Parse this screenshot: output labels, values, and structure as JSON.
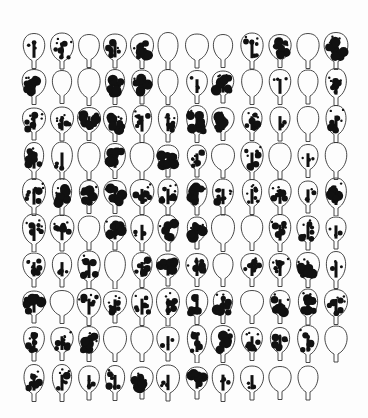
{
  "figure": {
    "background": "#ffffff",
    "ink": "#111111",
    "rows": 10,
    "columns": 12,
    "column_x": [
      34,
      62,
      89,
      115,
      142,
      168,
      197,
      223,
      252,
      280,
      308,
      336
    ],
    "row_y": [
      47,
      83,
      120,
      157,
      193,
      229,
      266,
      303,
      340,
      379
    ],
    "blotch_levels": [
      [
        1,
        2,
        0,
        2,
        3,
        0,
        0,
        0,
        2,
        3,
        0,
        3
      ],
      [
        3,
        0,
        0,
        3,
        3,
        0,
        1,
        3,
        0,
        1,
        0,
        2
      ],
      [
        2,
        2,
        3,
        3,
        2,
        2,
        3,
        3,
        2,
        1,
        0,
        2
      ],
      [
        3,
        1,
        0,
        3,
        0,
        3,
        2,
        0,
        2,
        0,
        1,
        0
      ],
      [
        2,
        3,
        3,
        3,
        2,
        2,
        3,
        2,
        2,
        2,
        1,
        3
      ],
      [
        2,
        2,
        0,
        3,
        1,
        3,
        3,
        0,
        0,
        2,
        2,
        1
      ],
      [
        2,
        1,
        2,
        0,
        2,
        3,
        2,
        0,
        2,
        2,
        3,
        1
      ],
      [
        3,
        0,
        2,
        2,
        2,
        2,
        2,
        3,
        0,
        3,
        3,
        2
      ],
      [
        2,
        2,
        3,
        0,
        0,
        1,
        2,
        3,
        2,
        2,
        2,
        0
      ],
      [
        2,
        2,
        1,
        2,
        3,
        1,
        3,
        1,
        1,
        0,
        0
      ]
    ]
  }
}
